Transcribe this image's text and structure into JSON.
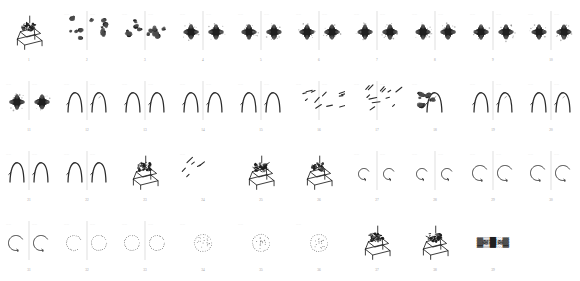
{
  "sheet": {
    "title": "Figure thumbnail contact sheet",
    "columns": 10,
    "rows": 4,
    "total_thumbnails": 39,
    "background_color": "#ffffff",
    "ink_color": "#2b2b2b",
    "caption_color": "#9a9a9a"
  },
  "thumbnails": [
    {
      "number": "1",
      "kind": "apparatus",
      "panels": 1,
      "note": "3D line drawing of a mechanical rig with caption beneath"
    },
    {
      "number": "2",
      "kind": "blobs",
      "panels": 2,
      "note": "two panels of scattered dark blobs with axis labels"
    },
    {
      "number": "3",
      "kind": "blobs",
      "panels": 2,
      "note": "left panel blob pair, right panel single cross blob"
    },
    {
      "number": "4",
      "kind": "cross",
      "panels": 2,
      "note": "two four-lobed cross-shaped diffraction blobs"
    },
    {
      "number": "5",
      "kind": "cross",
      "panels": 2,
      "note": "cross blob pair joined by a horizontal line"
    },
    {
      "number": "6",
      "kind": "cross",
      "panels": 2,
      "note": "cross blob at left and boxed dark blob at right"
    },
    {
      "number": "7",
      "kind": "cross",
      "panels": 2,
      "note": "two cross blobs separated by vertical divider"
    },
    {
      "number": "8",
      "kind": "cross",
      "panels": 2,
      "note": "two cross blobs, right panel unlabelled"
    },
    {
      "number": "9",
      "kind": "cross",
      "panels": 2,
      "note": "cross blobs with bracketed annotation at right"
    },
    {
      "number": "10",
      "kind": "cross",
      "panels": 2,
      "note": "cross blobs with stem annotations above and below"
    },
    {
      "number": "11",
      "kind": "cross",
      "panels": 2,
      "note": "two sharper star-shaped blobs with whiskers"
    },
    {
      "number": "12",
      "kind": "arch",
      "panels": 2,
      "note": "stroke fragments at left, arch curve at right"
    },
    {
      "number": "13",
      "kind": "arch",
      "panels": 2,
      "note": "arch curve in both panels"
    },
    {
      "number": "14",
      "kind": "arch",
      "panels": 2,
      "note": "paired arch curves"
    },
    {
      "number": "15",
      "kind": "arch",
      "panels": 2,
      "note": "paired arch curves"
    },
    {
      "number": "16",
      "kind": "strokes",
      "panels": 2,
      "note": "short angled stroke fragments across both panels"
    },
    {
      "number": "17",
      "kind": "strokes",
      "panels": 2,
      "note": "stroke fragments at left, filled arch at right"
    },
    {
      "number": "18",
      "kind": "blobarch",
      "panels": 1,
      "note": "dense dark blob merging into an arch"
    },
    {
      "number": "19",
      "kind": "arch",
      "panels": 2,
      "note": "partial arches with stroke fragments"
    },
    {
      "number": "20",
      "kind": "arch",
      "panels": 2,
      "note": "paired arch curves"
    },
    {
      "number": "21",
      "kind": "arch",
      "panels": 2,
      "note": "paired arch curves"
    },
    {
      "number": "22",
      "kind": "arch",
      "panels": 2,
      "note": "paired arch curves"
    },
    {
      "number": "23",
      "kind": "apparatus",
      "panels": 1,
      "note": "arch overlaid with mechanical rig sketch"
    },
    {
      "number": "24",
      "kind": "strokes",
      "panels": 1,
      "note": "three diagonal line segments"
    },
    {
      "number": "25",
      "kind": "apparatus",
      "panels": 1,
      "note": "3D mechanical rig line drawing"
    },
    {
      "number": "26",
      "kind": "apparatus",
      "panels": 1,
      "note": "3D mechanical rig line drawing, darker"
    },
    {
      "number": "27",
      "kind": "hook",
      "panels": 2,
      "note": "small hook strokes with arrows, two panels"
    },
    {
      "number": "28",
      "kind": "hook",
      "panels": 2,
      "note": "open hook arcs in both panels"
    },
    {
      "number": "29",
      "kind": "cee",
      "panels": 2,
      "note": "C-shaped arcs with arrow tips"
    },
    {
      "number": "30",
      "kind": "cee",
      "panels": 2,
      "note": "C-shaped arcs with arrow tips"
    },
    {
      "number": "31",
      "kind": "cee",
      "panels": 2,
      "note": "dotted C-shaped point tracks"
    },
    {
      "number": "32",
      "kind": "ceeo",
      "panels": 2,
      "note": "dotted C track and closed dotted circle"
    },
    {
      "number": "33",
      "kind": "circles",
      "panels": 2,
      "note": "two closed dotted circles"
    },
    {
      "number": "34",
      "kind": "circlefill",
      "panels": 1,
      "note": "dotted circle with horizontal chord of points"
    },
    {
      "number": "35",
      "kind": "circlefill",
      "panels": 1,
      "note": "dotted circle with internal scatter"
    },
    {
      "number": "36",
      "kind": "circlefill",
      "panels": 1,
      "note": "faint dotted circle outline"
    },
    {
      "number": "37",
      "kind": "apparatus",
      "panels": 1,
      "note": "3D mechanical rig line drawing"
    },
    {
      "number": "38",
      "kind": "apparatus",
      "panels": 1,
      "note": "3D mechanical rig line drawing"
    },
    {
      "number": "39",
      "kind": "glyphs",
      "panels": 1,
      "note": "row of dense dark glyph characters"
    }
  ]
}
